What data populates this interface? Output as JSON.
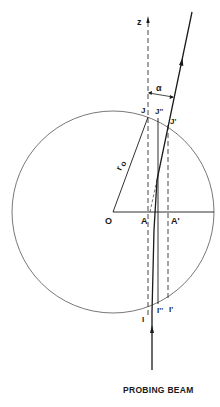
{
  "diagram": {
    "caption": "PROBING BEAM",
    "labels": {
      "z_axis": "z",
      "alpha": "α",
      "J": "J",
      "J_double_prime": "J''",
      "J_prime": "J'",
      "radius": "r",
      "radius_sub": "o",
      "O": "O",
      "A": "A",
      "A_prime": "A'",
      "I": "I",
      "I_double_prime": "I''",
      "I_prime": "I'"
    },
    "colors": {
      "line": "#1a1a1a",
      "circle": "#555555",
      "background": "#ffffff"
    }
  }
}
